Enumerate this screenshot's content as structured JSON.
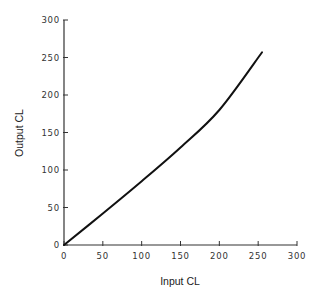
{
  "chart_data": {
    "type": "line",
    "title": "",
    "xlabel": "Input CL",
    "ylabel": "Output CL",
    "xlim": [
      0,
      300
    ],
    "ylim": [
      0,
      300
    ],
    "xticks": [
      0,
      50,
      100,
      150,
      200,
      250,
      300
    ],
    "yticks": [
      0,
      50,
      100,
      150,
      200,
      250,
      300
    ],
    "grid": false,
    "legend": null,
    "series": [
      {
        "name": "Output CL",
        "color": "#111111",
        "x": [
          0,
          50,
          100,
          150,
          200,
          255
        ],
        "y": [
          0,
          42,
          85,
          130,
          180,
          257
        ]
      }
    ]
  }
}
